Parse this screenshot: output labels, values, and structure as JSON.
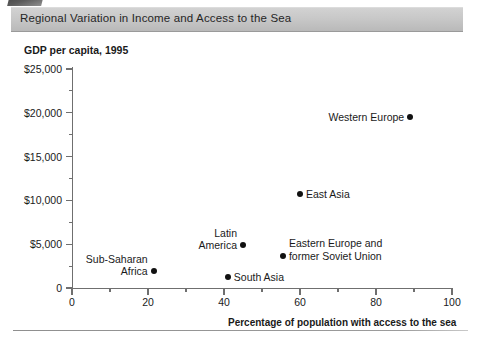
{
  "header": {
    "title": "Regional Variation in Income and Access to the Sea",
    "corner_tab_icon": "figure-tab-shape"
  },
  "chart_data": {
    "type": "scatter",
    "title": "Regional Variation in Income and Access to the Sea",
    "ylabel": "GDP per capita, 1995",
    "xlabel": "Percentage of population with access to the sea",
    "xlim": [
      0,
      100
    ],
    "ylim": [
      0,
      25000
    ],
    "xticks": [
      0,
      20,
      40,
      60,
      80,
      100
    ],
    "xtick_labels": [
      "0",
      "20",
      "40",
      "60",
      "80",
      "100"
    ],
    "x_minor_ticks": [
      10,
      30,
      50,
      70,
      90
    ],
    "yticks": [
      0,
      5000,
      10000,
      15000,
      20000,
      25000
    ],
    "ytick_labels": [
      "0",
      "$5,000",
      "$10,000",
      "$15,000",
      "$20,000",
      "$25,000"
    ],
    "y_minor_ticks": [
      2500,
      7500,
      12500,
      17500,
      22500
    ],
    "grid": false,
    "legend": "none",
    "marker_color": "#111111",
    "points": [
      {
        "name": "Western Europe",
        "label": "Western Europe",
        "x": 89,
        "y": 19500,
        "label_side": "left",
        "label_lines": [
          "Western Europe"
        ]
      },
      {
        "name": "East Asia",
        "label": "East Asia",
        "x": 60,
        "y": 10700,
        "label_side": "right",
        "label_lines": [
          "East Asia"
        ]
      },
      {
        "name": "Latin America",
        "label": "Latin America",
        "x": 45,
        "y": 4900,
        "label_side": "left",
        "label_lines": [
          "Latin",
          "America"
        ]
      },
      {
        "name": "Eastern Europe and former Soviet Union",
        "label": "Eastern Europe and former Soviet Union",
        "x": 55.5,
        "y": 3700,
        "label_side": "right",
        "label_lines": [
          "Eastern Europe and",
          "former Soviet Union"
        ]
      },
      {
        "name": "Sub-Saharan Africa",
        "label": "Sub-Saharan Africa",
        "x": 21.5,
        "y": 1900,
        "label_side": "left",
        "label_lines": [
          "Sub-Saharan",
          "Africa"
        ]
      },
      {
        "name": "South Asia",
        "label": "South Asia",
        "x": 41,
        "y": 1300,
        "label_side": "right",
        "label_lines": [
          "South Asia"
        ]
      }
    ]
  }
}
